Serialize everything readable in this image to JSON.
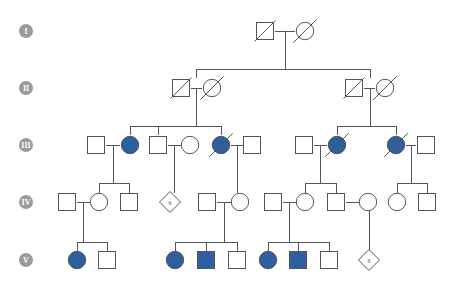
{
  "chart_data": {
    "type": "diagram",
    "subtype": "pedigree",
    "legend": {
      "affected_color": "#2e5f9e",
      "unaffected_color": "#ffffff",
      "line_color": "#555555",
      "badge_color": "#9a9a9a",
      "affected_meaning": "filled symbol",
      "deceased_meaning": "diagonal slash through symbol",
      "male_shape": "square",
      "female_shape": "circle",
      "unknown_sex_shape": "diamond"
    },
    "generations": [
      {
        "id": "I",
        "label": "I",
        "badge_x": 26,
        "badge_y": 31,
        "row_y": 31,
        "members": [
          {
            "id": "I-1",
            "sex": "male",
            "shape": "square",
            "affected": false,
            "deceased": true,
            "x": 265,
            "y": 31
          },
          {
            "id": "I-2",
            "sex": "female",
            "shape": "circle",
            "affected": false,
            "deceased": true,
            "x": 305,
            "y": 31
          }
        ]
      },
      {
        "id": "II",
        "label": "II",
        "badge_x": 26,
        "badge_y": 88,
        "row_y": 88,
        "members": [
          {
            "id": "II-1",
            "sex": "male",
            "shape": "square",
            "affected": false,
            "deceased": true,
            "x": 181,
            "y": 88
          },
          {
            "id": "II-2",
            "sex": "female",
            "shape": "circle",
            "affected": false,
            "deceased": true,
            "x": 212,
            "y": 88
          },
          {
            "id": "II-3",
            "sex": "male",
            "shape": "square",
            "affected": false,
            "deceased": true,
            "x": 354,
            "y": 88
          },
          {
            "id": "II-4",
            "sex": "female",
            "shape": "circle",
            "affected": false,
            "deceased": true,
            "x": 385,
            "y": 88
          }
        ]
      },
      {
        "id": "III",
        "label": "III",
        "badge_x": 26,
        "badge_y": 145,
        "row_y": 145,
        "members": [
          {
            "id": "III-1",
            "sex": "male",
            "shape": "square",
            "affected": false,
            "deceased": false,
            "x": 96,
            "y": 145
          },
          {
            "id": "III-2",
            "sex": "female",
            "shape": "circle",
            "affected": true,
            "deceased": false,
            "x": 130,
            "y": 145
          },
          {
            "id": "III-3",
            "sex": "male",
            "shape": "square",
            "affected": false,
            "deceased": false,
            "x": 158,
            "y": 145
          },
          {
            "id": "III-4",
            "sex": "female",
            "shape": "circle",
            "affected": false,
            "deceased": false,
            "x": 190,
            "y": 145
          },
          {
            "id": "III-5",
            "sex": "female",
            "shape": "circle",
            "affected": true,
            "deceased": true,
            "x": 221,
            "y": 145
          },
          {
            "id": "III-6",
            "sex": "male",
            "shape": "square",
            "affected": false,
            "deceased": false,
            "x": 252,
            "y": 145
          },
          {
            "id": "III-7",
            "sex": "male",
            "shape": "square",
            "affected": false,
            "deceased": false,
            "x": 304,
            "y": 145
          },
          {
            "id": "III-8",
            "sex": "female",
            "shape": "circle",
            "affected": true,
            "deceased": true,
            "x": 337,
            "y": 145
          },
          {
            "id": "III-9",
            "sex": "female",
            "shape": "circle",
            "affected": true,
            "deceased": true,
            "x": 396,
            "y": 145
          },
          {
            "id": "III-10",
            "sex": "male",
            "shape": "square",
            "affected": false,
            "deceased": false,
            "x": 426,
            "y": 145
          }
        ]
      },
      {
        "id": "IV",
        "label": "IV",
        "badge_x": 26,
        "badge_y": 202,
        "row_y": 202,
        "members": [
          {
            "id": "IV-1",
            "sex": "male",
            "shape": "square",
            "affected": false,
            "deceased": false,
            "x": 67,
            "y": 202
          },
          {
            "id": "IV-2",
            "sex": "female",
            "shape": "circle",
            "affected": false,
            "deceased": false,
            "x": 99,
            "y": 202
          },
          {
            "id": "IV-3",
            "sex": "male",
            "shape": "square",
            "affected": false,
            "deceased": false,
            "x": 129,
            "y": 202
          },
          {
            "id": "IV-4",
            "sex": "unknown",
            "shape": "diamond",
            "affected": false,
            "deceased": false,
            "count": "6",
            "x": 170,
            "y": 202
          },
          {
            "id": "IV-5",
            "sex": "male",
            "shape": "square",
            "affected": false,
            "deceased": false,
            "x": 207,
            "y": 202
          },
          {
            "id": "IV-6",
            "sex": "female",
            "shape": "circle",
            "affected": false,
            "deceased": false,
            "x": 240,
            "y": 202
          },
          {
            "id": "IV-7",
            "sex": "male",
            "shape": "square",
            "affected": false,
            "deceased": false,
            "x": 273,
            "y": 202
          },
          {
            "id": "IV-8",
            "sex": "female",
            "shape": "circle",
            "affected": false,
            "deceased": false,
            "x": 305,
            "y": 202
          },
          {
            "id": "IV-9",
            "sex": "male",
            "shape": "square",
            "affected": false,
            "deceased": false,
            "x": 336,
            "y": 202
          },
          {
            "id": "IV-10",
            "sex": "female",
            "shape": "circle",
            "affected": false,
            "deceased": false,
            "x": 368,
            "y": 202
          },
          {
            "id": "IV-11",
            "sex": "female",
            "shape": "circle",
            "affected": false,
            "deceased": false,
            "x": 397,
            "y": 202
          },
          {
            "id": "IV-12",
            "sex": "male",
            "shape": "square",
            "affected": false,
            "deceased": false,
            "x": 427,
            "y": 202
          }
        ]
      },
      {
        "id": "V",
        "label": "V",
        "badge_x": 26,
        "badge_y": 260,
        "row_y": 260,
        "members": [
          {
            "id": "V-1",
            "sex": "female",
            "shape": "circle",
            "affected": true,
            "deceased": false,
            "x": 77,
            "y": 260
          },
          {
            "id": "V-2",
            "sex": "male",
            "shape": "square",
            "affected": false,
            "deceased": false,
            "x": 107,
            "y": 260
          },
          {
            "id": "V-3",
            "sex": "female",
            "shape": "circle",
            "affected": true,
            "deceased": false,
            "x": 175,
            "y": 260
          },
          {
            "id": "V-4",
            "sex": "male",
            "shape": "square",
            "affected": true,
            "deceased": false,
            "x": 206,
            "y": 260
          },
          {
            "id": "V-5",
            "sex": "male",
            "shape": "square",
            "affected": false,
            "deceased": false,
            "x": 237,
            "y": 260
          },
          {
            "id": "V-6",
            "sex": "female",
            "shape": "circle",
            "affected": true,
            "deceased": false,
            "x": 268,
            "y": 260
          },
          {
            "id": "V-7",
            "sex": "male",
            "shape": "square",
            "affected": true,
            "deceased": false,
            "x": 298,
            "y": 260
          },
          {
            "id": "V-8",
            "sex": "male",
            "shape": "square",
            "affected": false,
            "deceased": false,
            "x": 329,
            "y": 260
          },
          {
            "id": "V-9",
            "sex": "unknown",
            "shape": "diamond",
            "affected": false,
            "deceased": false,
            "count": "6",
            "x": 369,
            "y": 260
          }
        ]
      }
    ],
    "connections": [
      {
        "name": "mate-I-1-I-2",
        "type": "mate",
        "points": "275,31 295,31"
      },
      {
        "name": "desc-I-drop",
        "type": "descent",
        "points": "285,31 285,69"
      },
      {
        "name": "sib-II-bar",
        "type": "sibship",
        "points": "196,69 370,69"
      },
      {
        "name": "sib-II-left-up",
        "type": "sibship",
        "points": "196,69 196,78"
      },
      {
        "name": "sib-II-right-up",
        "type": "sibship",
        "points": "370,69 370,78"
      },
      {
        "name": "mate-II-1-II-2",
        "type": "mate",
        "points": "191,88 202,88"
      },
      {
        "name": "desc-II-left-drop",
        "type": "descent",
        "points": "196,88 196,126"
      },
      {
        "name": "sib-III-left-bar",
        "type": "sibship",
        "points": "130,126 221,126"
      },
      {
        "name": "sib-III-left-c1",
        "type": "sibship",
        "points": "130,126 130,135"
      },
      {
        "name": "sib-III-left-c2",
        "type": "sibship",
        "points": "158,126 158,135"
      },
      {
        "name": "sib-III-left-c3",
        "type": "sibship",
        "points": "221,126 221,135"
      },
      {
        "name": "mate-II-3-II-4",
        "type": "mate",
        "points": "364,88 375,88"
      },
      {
        "name": "desc-II-right-drop",
        "type": "descent",
        "points": "370,88 370,126"
      },
      {
        "name": "sib-III-right-bar",
        "type": "sibship",
        "points": "337,126 396,126"
      },
      {
        "name": "sib-III-right-c1",
        "type": "sibship",
        "points": "337,126 337,135"
      },
      {
        "name": "sib-III-right-c2",
        "type": "sibship",
        "points": "396,126 396,135"
      },
      {
        "name": "mate-III-1-III-2",
        "type": "mate",
        "points": "106,145 120,145"
      },
      {
        "name": "desc-III-1-drop",
        "type": "descent",
        "points": "113,145 113,183"
      },
      {
        "name": "sib-IV-a-bar",
        "type": "sibship",
        "points": "99,183 129,183"
      },
      {
        "name": "sib-IV-a-c1",
        "type": "sibship",
        "points": "99,183 99,193"
      },
      {
        "name": "sib-IV-a-c2",
        "type": "sibship",
        "points": "129,183 129,193"
      },
      {
        "name": "mate-III-3-III-4",
        "type": "mate",
        "points": "168,145 181,145"
      },
      {
        "name": "desc-III-3-drop",
        "type": "descent",
        "points": "174,145 174,193"
      },
      {
        "name": "mate-III-5-III-6",
        "type": "mate",
        "points": "231,145 243,145"
      },
      {
        "name": "desc-III-5-drop",
        "type": "descent",
        "points": "237,145 237,193"
      },
      {
        "name": "mate-III-7-III-8",
        "type": "mate",
        "points": "314,145 327,145"
      },
      {
        "name": "desc-III-7-drop",
        "type": "descent",
        "points": "320,145 320,183"
      },
      {
        "name": "sib-IV-b-bar",
        "type": "sibship",
        "points": "305,183 336,183"
      },
      {
        "name": "sib-IV-b-c1",
        "type": "sibship",
        "points": "305,183 305,193"
      },
      {
        "name": "sib-IV-b-c2",
        "type": "sibship",
        "points": "336,183 336,193"
      },
      {
        "name": "mate-III-9-III-10",
        "type": "mate",
        "points": "406,145 416,145"
      },
      {
        "name": "desc-III-9-drop",
        "type": "descent",
        "points": "411,145 411,183"
      },
      {
        "name": "sib-IV-c-bar",
        "type": "sibship",
        "points": "397,183 427,183"
      },
      {
        "name": "sib-IV-c-c1",
        "type": "sibship",
        "points": "397,183 397,193"
      },
      {
        "name": "sib-IV-c-c2",
        "type": "sibship",
        "points": "427,183 427,193"
      },
      {
        "name": "mate-IV-1-IV-2",
        "type": "mate",
        "points": "77,202 90,202"
      },
      {
        "name": "desc-IV-1-drop",
        "type": "descent",
        "points": "83,202 83,242"
      },
      {
        "name": "sib-V-a-bar",
        "type": "sibship",
        "points": "77,242 107,242"
      },
      {
        "name": "sib-V-a-c1",
        "type": "sibship",
        "points": "77,242 77,251"
      },
      {
        "name": "sib-V-a-c2",
        "type": "sibship",
        "points": "107,242 107,251"
      },
      {
        "name": "mate-IV-5-IV-6",
        "type": "mate",
        "points": "217,202 231,202"
      },
      {
        "name": "desc-IV-5-drop",
        "type": "descent",
        "points": "224,202 224,242"
      },
      {
        "name": "sib-V-b-bar",
        "type": "sibship",
        "points": "175,242 237,242"
      },
      {
        "name": "sib-V-b-c1",
        "type": "sibship",
        "points": "175,242 175,251"
      },
      {
        "name": "sib-V-b-c2",
        "type": "sibship",
        "points": "206,242 206,251"
      },
      {
        "name": "sib-V-b-c3",
        "type": "sibship",
        "points": "237,242 237,251"
      },
      {
        "name": "mate-IV-7-IV-8",
        "type": "mate",
        "points": "283,202 296,202"
      },
      {
        "name": "desc-IV-7-drop",
        "type": "descent",
        "points": "289,202 289,242"
      },
      {
        "name": "sib-V-c-bar",
        "type": "sibship",
        "points": "268,242 329,242"
      },
      {
        "name": "sib-V-c-c1",
        "type": "sibship",
        "points": "268,242 268,251"
      },
      {
        "name": "sib-V-c-c2",
        "type": "sibship",
        "points": "298,242 298,251"
      },
      {
        "name": "sib-V-c-c3",
        "type": "sibship",
        "points": "329,242 329,251"
      },
      {
        "name": "mate-IV-9-IV-10",
        "type": "mate",
        "points": "346,202 359,202"
      },
      {
        "name": "desc-IV-9-drop",
        "type": "descent",
        "points": "369,202 369,251"
      },
      {
        "name": "mate-IV-9-bar",
        "type": "mate",
        "points": "369,202 369,202"
      }
    ]
  }
}
